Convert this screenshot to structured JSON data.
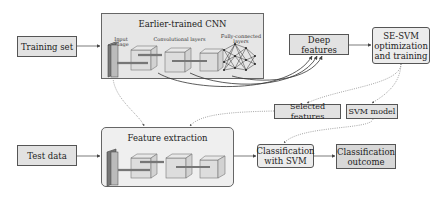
{
  "diagram": {
    "nodes": {
      "training_set": "Training set",
      "test_data": "Test data",
      "cnn_group_title": "Earlier-trained CNN",
      "cnn_input_label": "Input image",
      "cnn_conv_label": "Convolutional layers",
      "cnn_fc_label_1": "Fully-connected",
      "cnn_fc_label_2": "layers",
      "deep_features": "Deep features",
      "sesvm_1": "SE-SVM",
      "sesvm_2": "optimization",
      "sesvm_3": "and training",
      "selected_features": "Selected features",
      "svm_model": "SVM model",
      "feature_extraction_title": "Feature extraction",
      "classification_svm_1": "Classification",
      "classification_svm_2": "with SVM",
      "classification_outcome_1": "Classification",
      "classification_outcome_2": "outcome"
    },
    "edges": [
      {
        "from": "Training set",
        "to": "Earlier-trained CNN",
        "style": "solid"
      },
      {
        "from": "Earlier-trained CNN",
        "to": "Deep features",
        "style": "solid-curved"
      },
      {
        "from": "Deep features",
        "to": "SE-SVM optimization and training",
        "style": "solid"
      },
      {
        "from": "SE-SVM optimization and training",
        "to": "Selected features",
        "style": "dotted"
      },
      {
        "from": "SE-SVM optimization and training",
        "to": "SVM model",
        "style": "dotted"
      },
      {
        "from": "Earlier-trained CNN",
        "to": "Feature extraction",
        "style": "dotted"
      },
      {
        "from": "Selected features",
        "to": "Feature extraction",
        "style": "dotted"
      },
      {
        "from": "SVM model",
        "to": "Classification with SVM",
        "style": "dotted"
      },
      {
        "from": "Test data",
        "to": "Feature extraction",
        "style": "solid"
      },
      {
        "from": "Feature extraction",
        "to": "Classification with SVM",
        "style": "solid"
      },
      {
        "from": "Classification with SVM",
        "to": "Classification outcome",
        "style": "solid"
      }
    ],
    "colors": {
      "box_fill": "#e2e2e2",
      "group_fill": "#e6e6e6",
      "stroke": "#555555"
    }
  }
}
